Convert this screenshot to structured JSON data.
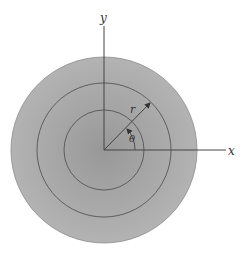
{
  "diagram": {
    "center": {
      "x": 104,
      "y": 150
    },
    "disk": {
      "radius": 93,
      "fill": "#a9a9a9",
      "fill_center": "#9a9a9a",
      "stroke": "#888888"
    },
    "circles": [
      {
        "name": "inner",
        "radius": 40
      },
      {
        "name": "middle",
        "radius": 67
      }
    ],
    "circle_stroke": "#555555",
    "axis_color": "#444444",
    "axes": {
      "x": {
        "label": "x",
        "x_end": 226
      },
      "y": {
        "label": "y",
        "y_start": 26
      }
    },
    "radius_line": {
      "label": "r",
      "angle_deg": 45
    },
    "angle": {
      "label": "θ"
    }
  }
}
